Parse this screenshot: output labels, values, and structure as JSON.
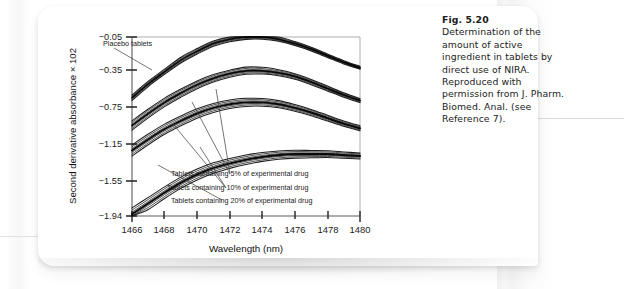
{
  "figure": {
    "axis": {
      "x_label": "Wavelength (nm)",
      "y_label": "Second derivative absorbance × 102",
      "x_ticks": [
        "1466",
        "1468",
        "1470",
        "1472",
        "1474",
        "1476",
        "1478",
        "1480"
      ],
      "y_ticks": [
        "−0.05",
        "−0.35",
        "−0.75",
        "−1.15",
        "−1.55",
        "−1.94"
      ]
    },
    "annotations": [
      {
        "id": "placebo",
        "text": "Placebo tablets"
      },
      {
        "id": "drug5",
        "text": "Tablets containing 5% of experimental drug"
      },
      {
        "id": "drug10",
        "text": "Tablets containing 10% of experimental drug"
      },
      {
        "id": "drug20",
        "text": "Tablets containing 20% of experimental drug"
      }
    ]
  },
  "caption": {
    "number": "Fig. 5.20",
    "text": "Determination of the amount of active ingredient in tablets by direct use of NIRA. Reproduced with permission from J. Pharm. Biomed. Anal. (see Reference 7)."
  },
  "chart_data": {
    "type": "line",
    "title": "",
    "xlabel": "Wavelength (nm)",
    "ylabel": "Second derivative absorbance × 102",
    "xlim": [
      1466,
      1480
    ],
    "ylim": [
      -1.94,
      -0.05
    ],
    "xticks": [
      1466,
      1468,
      1470,
      1472,
      1474,
      1476,
      1478,
      1480
    ],
    "yticks": [
      -0.05,
      -0.35,
      -0.75,
      -1.15,
      -1.55,
      -1.94
    ],
    "grid": false,
    "legend": "annotations-with-leader-lines",
    "x": [
      1466,
      1467,
      1468,
      1469,
      1470,
      1471,
      1472,
      1473,
      1474,
      1475,
      1476,
      1477,
      1478,
      1479,
      1480
    ],
    "series": [
      {
        "name": "Placebo tablets",
        "color": "#111111",
        "band_width": 0.03,
        "values": [
          -0.65,
          -0.5,
          -0.37,
          -0.26,
          -0.18,
          -0.11,
          -0.07,
          -0.05,
          -0.05,
          -0.07,
          -0.11,
          -0.16,
          -0.22,
          -0.28,
          -0.33
        ]
      },
      {
        "name": "Tablets containing 5% of experimental drug",
        "color": "#111111",
        "band_width": 0.05,
        "values": [
          -0.95,
          -0.82,
          -0.7,
          -0.6,
          -0.51,
          -0.44,
          -0.39,
          -0.36,
          -0.36,
          -0.38,
          -0.42,
          -0.48,
          -0.55,
          -0.62,
          -0.68
        ]
      },
      {
        "name": "Tablets containing 10% of experimental drug",
        "color": "#111111",
        "band_width": 0.06,
        "values": [
          -1.22,
          -1.1,
          -0.99,
          -0.9,
          -0.82,
          -0.76,
          -0.72,
          -0.7,
          -0.7,
          -0.72,
          -0.76,
          -0.81,
          -0.87,
          -0.93,
          -0.98
        ]
      },
      {
        "name": "Tablets containing 20% of experimental drug",
        "color": "#111111",
        "band_width": 0.07,
        "values": [
          -1.92,
          -1.8,
          -1.68,
          -1.57,
          -1.48,
          -1.41,
          -1.36,
          -1.32,
          -1.29,
          -1.27,
          -1.26,
          -1.26,
          -1.26,
          -1.27,
          -1.28
        ]
      }
    ]
  }
}
